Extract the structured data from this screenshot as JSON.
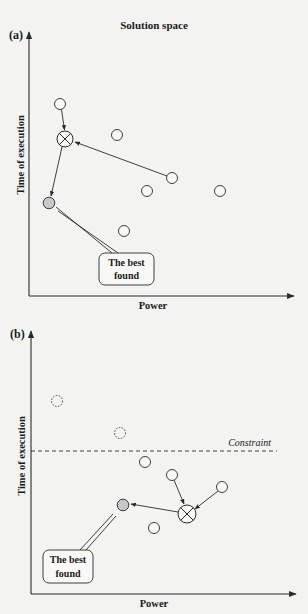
{
  "figure": {
    "title": "Solution space",
    "panels": [
      {
        "id": "a",
        "label": "(a)",
        "x_axis_label": "Power",
        "y_axis_label": "Time of execution",
        "callout": {
          "line1": "The best",
          "line2": "found"
        },
        "points": [
          {
            "type": "open",
            "x": 60,
            "y": 104
          },
          {
            "type": "open",
            "x": 117,
            "y": 135
          },
          {
            "type": "selected-x",
            "x": 65,
            "y": 139
          },
          {
            "type": "open",
            "x": 172,
            "y": 178
          },
          {
            "type": "open",
            "x": 147,
            "y": 191
          },
          {
            "type": "open",
            "x": 220,
            "y": 191
          },
          {
            "type": "best-gray",
            "x": 49,
            "y": 203
          },
          {
            "type": "open",
            "x": 124,
            "y": 231
          }
        ]
      },
      {
        "id": "b",
        "label": "(b)",
        "x_axis_label": "Power",
        "y_axis_label": "Time of execution",
        "constraint_label": "Constraint",
        "callout": {
          "line1": "The best",
          "line2": "found"
        },
        "points": [
          {
            "type": "dashed",
            "x": 57,
            "y": 401
          },
          {
            "type": "dashed",
            "x": 120,
            "y": 433
          },
          {
            "type": "open",
            "x": 145,
            "y": 462
          },
          {
            "type": "open",
            "x": 172,
            "y": 475
          },
          {
            "type": "open",
            "x": 222,
            "y": 487
          },
          {
            "type": "best-gray",
            "x": 123,
            "y": 505
          },
          {
            "type": "selected-x",
            "x": 187,
            "y": 514
          },
          {
            "type": "open",
            "x": 154,
            "y": 528
          }
        ]
      }
    ],
    "colors": {
      "line": "#2a2a2a",
      "best_fill": "#c8c8c8",
      "background": "#f3f3f1"
    }
  }
}
